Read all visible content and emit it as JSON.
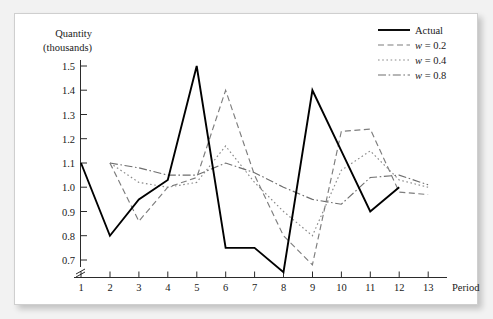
{
  "chart_data": {
    "type": "line",
    "title": "",
    "ylabel": "Quantity (thousands)",
    "ylabel_line1": "Quantity",
    "ylabel_line2": "(thousands)",
    "xlabel": "Period",
    "x": [
      1,
      2,
      3,
      4,
      5,
      6,
      7,
      8,
      9,
      10,
      11,
      12,
      13
    ],
    "xtick_labels": [
      "1",
      "2",
      "3",
      "4",
      "5",
      "6",
      "7",
      "8",
      "9",
      "10",
      "11",
      "12",
      "13"
    ],
    "ytick_labels": [
      "0.7",
      "0.8",
      "0.9",
      "1.0",
      "1.1",
      "1.2",
      "1.3",
      "1.4",
      "1.5"
    ],
    "ytick_values": [
      0.7,
      0.8,
      0.9,
      1.0,
      1.1,
      1.2,
      1.3,
      1.4,
      1.5
    ],
    "ylim": [
      0.65,
      1.53
    ],
    "xlim": [
      1,
      13
    ],
    "grid": false,
    "axis_break_y": true,
    "axis_break_x": true,
    "legend_position": "top-right",
    "series": [
      {
        "name": "Actual",
        "style": "solid",
        "color": "#000000",
        "x": [
          1,
          2,
          3,
          4,
          5,
          6,
          7,
          8,
          9,
          10,
          11,
          12
        ],
        "values": [
          1.1,
          0.8,
          0.95,
          1.03,
          1.5,
          0.75,
          0.75,
          0.65,
          1.4,
          1.15,
          0.9,
          1.0
        ]
      },
      {
        "name": "w = 0.2",
        "style": "dashed",
        "color": "#7d7d7d",
        "x": [
          2,
          3,
          4,
          5,
          6,
          7,
          8,
          9,
          10,
          11,
          12,
          13
        ],
        "values": [
          1.1,
          0.86,
          1.0,
          1.04,
          1.4,
          1.05,
          0.8,
          0.68,
          1.23,
          1.24,
          0.98,
          0.97
        ]
      },
      {
        "name": "w = 0.4",
        "style": "dotted",
        "color": "#8a8a8a",
        "x": [
          2,
          3,
          4,
          5,
          6,
          7,
          8,
          9,
          10,
          11,
          12,
          13
        ],
        "values": [
          1.1,
          1.02,
          1.0,
          1.02,
          1.17,
          1.02,
          0.9,
          0.8,
          1.07,
          1.15,
          1.03,
          1.0
        ]
      },
      {
        "name": "w = 0.8",
        "style": "dash-dot",
        "color": "#6e6e6e",
        "x": [
          2,
          3,
          4,
          5,
          6,
          7,
          8,
          9,
          10,
          11,
          12,
          13
        ],
        "values": [
          1.1,
          1.08,
          1.05,
          1.05,
          1.1,
          1.06,
          1.0,
          0.95,
          0.93,
          1.04,
          1.05,
          1.01
        ]
      }
    ]
  },
  "legend": {
    "entries": [
      {
        "label": "Actual",
        "style": "solid"
      },
      {
        "label": "w = 0.2",
        "style": "dashed"
      },
      {
        "label": "w = 0.4",
        "style": "dotted"
      },
      {
        "label": "w = 0.8",
        "style": "dash-dot"
      }
    ]
  },
  "axes": {
    "y_caption_line1": "Quantity",
    "y_caption_line2": "(thousands)",
    "x_caption": "Period"
  }
}
